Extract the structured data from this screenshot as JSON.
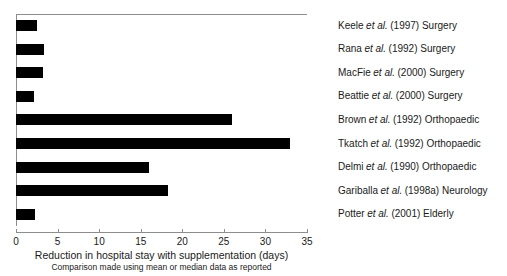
{
  "chart_data": {
    "type": "bar",
    "orientation": "horizontal",
    "title": "",
    "xlabel": "Reduction in hospital stay with supplementation (days)",
    "sublabel": "Comparison made using mean or median data as reported",
    "ylabel": "",
    "xlim": [
      0,
      35
    ],
    "xticks": [
      0,
      5,
      10,
      15,
      20,
      25,
      30,
      35
    ],
    "xtick_labels": [
      "0",
      "5",
      "10",
      "15",
      "20",
      "25",
      "30",
      "35"
    ],
    "grid": false,
    "legend": "none",
    "bar_color": "#000000",
    "categories": [
      "Keele et al. (1997) Surgery",
      "Rana et al. (1992) Surgery",
      "MacFie et al. (2000) Surgery",
      "Beattie et al. (2000) Surgery",
      "Brown et al. (1992) Orthopaedic",
      "Tkatch et al. (1992) Orthopaedic",
      "Delmi et al. (1990) Orthopaedic",
      "Gariballa et al. (1998a) Neurology",
      "Potter et al. (2001) Elderly"
    ],
    "values": [
      2.5,
      3.4,
      3.3,
      2.2,
      26.0,
      33.0,
      16.0,
      18.3,
      2.3
    ],
    "points": [
      {
        "author": "Keele",
        "etal": "et al.",
        "rest": "(1997) Surgery",
        "value": 2.5
      },
      {
        "author": "Rana",
        "etal": "et al.",
        "rest": "(1992) Surgery",
        "value": 3.4
      },
      {
        "author": "MacFie",
        "etal": "et al.",
        "rest": "(2000) Surgery",
        "value": 3.3
      },
      {
        "author": "Beattie",
        "etal": "et al.",
        "rest": "(2000) Surgery",
        "value": 2.2
      },
      {
        "author": "Brown",
        "etal": "et al.",
        "rest": "(1992) Orthopaedic",
        "value": 26.0
      },
      {
        "author": "Tkatch",
        "etal": "et al.",
        "rest": "(1992) Orthopaedic",
        "value": 33.0
      },
      {
        "author": "Delmi",
        "etal": "et al.",
        "rest": "(1990) Orthopaedic",
        "value": 16.0
      },
      {
        "author": "Gariballa",
        "etal": "et al.",
        "rest": "(1998a) Neurology",
        "value": 18.3
      },
      {
        "author": "Potter",
        "etal": "et al.",
        "rest": "(2001) Elderly",
        "value": 2.3
      }
    ]
  }
}
